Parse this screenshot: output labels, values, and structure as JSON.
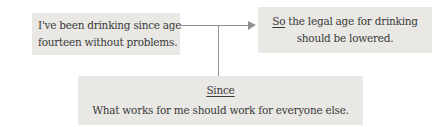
{
  "diagram": {
    "premise_box": {
      "line1": "I've been drinking since age",
      "line2": "fourteen without problems."
    },
    "conclusion_box": {
      "line1_underlined": "So",
      "line1_rest": " the legal age for drinking",
      "line2": "should be lowered."
    },
    "warrant_box": {
      "heading": "Since",
      "body": "What works for me should work for everyone else."
    },
    "colors": {
      "background": "#ffffff",
      "box_bg": "#e9e8e5",
      "text": "#3a3a3a",
      "connector": "#919191"
    },
    "icons": {
      "arrow": "arrow-right-icon"
    }
  }
}
